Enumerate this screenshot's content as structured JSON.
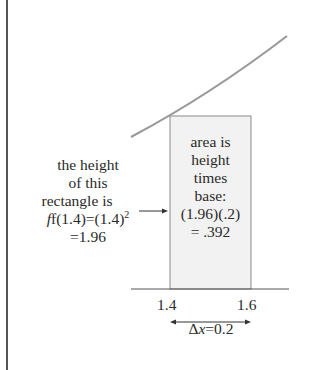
{
  "diagram": {
    "type": "riemann-rectangle",
    "function": "f(x) = x^2",
    "left_label": {
      "lines": [
        "the height",
        "of this",
        "rectangle is",
        "f(1.4)=(1.4)",
        "=1.96"
      ],
      "superscript": "2",
      "arrow": "→"
    },
    "box_label": {
      "lines": [
        "area is",
        "height",
        "times",
        "base:",
        "(1.96)(.2)",
        "= .392"
      ]
    },
    "ticks": [
      "1.4",
      "1.6"
    ],
    "dx_label": {
      "symbol": "Δ",
      "var": "x",
      "rest": "=0.2"
    },
    "colors": {
      "curve": "#9a9a9a",
      "rect_fill": "#f2f2f2",
      "rect_stroke": "#8a8a8a",
      "axis": "#555555",
      "frame_left": "#555555",
      "text": "#2a2a2a"
    }
  }
}
